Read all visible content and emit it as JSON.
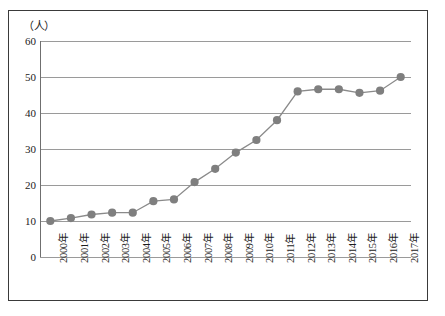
{
  "chart_data": {
    "type": "line",
    "title": "",
    "xlabel": "",
    "ylabel": "（人）",
    "unit_label": "（人）",
    "categories": [
      "2000年",
      "2001年",
      "2002年",
      "2003年",
      "2004年",
      "2005年",
      "2006年",
      "2007年",
      "2008年",
      "2009年",
      "2010年",
      "2011年",
      "2012年",
      "2013年",
      "2014年",
      "2015年",
      "2016年",
      "2017年"
    ],
    "values": [
      10,
      10.8,
      11.8,
      12.3,
      12.3,
      15.5,
      16,
      20.8,
      24.5,
      29,
      32.5,
      38,
      46,
      46.6,
      46.6,
      45.6,
      46.2,
      50
    ],
    "series": [
      {
        "name": "人数",
        "values": [
          10,
          10.8,
          11.8,
          12.3,
          12.3,
          15.5,
          16,
          20.8,
          24.5,
          29,
          32.5,
          38,
          46,
          46.6,
          46.6,
          45.6,
          46.2,
          50
        ]
      }
    ],
    "ylim": [
      0,
      60
    ],
    "yticks": [
      0,
      10,
      20,
      30,
      40,
      50,
      60
    ],
    "ytick_labels": [
      "0",
      "10",
      "20",
      "30",
      "40",
      "50",
      "60"
    ],
    "grid": true,
    "legend": false,
    "legend_position": "none",
    "marker": "circle",
    "colors": {
      "line": "#8a8a8a",
      "marker": "#7f7f7f",
      "grid": "#9a9a9a",
      "axis": "#6f6f6f",
      "frame": "#3a3a3a",
      "text": "#1d1d1d"
    }
  }
}
